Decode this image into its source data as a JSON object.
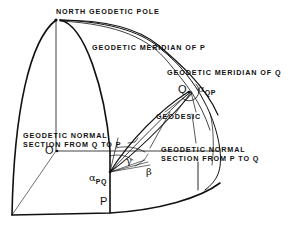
{
  "diagram": {
    "labels": {
      "north_pole": "NORTH GEODETIC POLE",
      "meridian_p": "GEODETIC MERIDIAN OF P",
      "meridian_q": "GEODETIC MERIDIAN OF Q",
      "geodesic": "GEODESIC",
      "normal_q_to_p_line1": "GEODETIC NORMAL",
      "normal_q_to_p_line2": "SECTION FROM Q TO P",
      "normal_p_to_q_line1": "GEODETIC NORMAL",
      "normal_p_to_q_line2": "SECTION FROM P TO Q"
    },
    "points": {
      "o": "O",
      "p": "P",
      "q": "Q"
    },
    "angles": {
      "alpha_qp_symbol": "α",
      "alpha_qp_sub": "QP",
      "alpha_pq_symbol": "α",
      "alpha_pq_sub": "PQ",
      "gamma": "γ",
      "beta": "β"
    },
    "colors": {
      "line": "#111111",
      "background": "#ffffff"
    }
  }
}
